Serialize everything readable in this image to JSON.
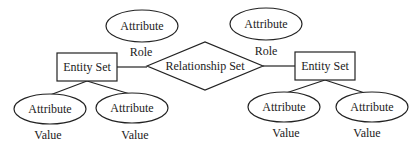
{
  "diagram": {
    "type": "entity-relationship",
    "relationship": {
      "label": "Relationship Set"
    },
    "left": {
      "entity": {
        "label": "Entity Set"
      },
      "role_attribute": {
        "label": "Attribute",
        "caption": "Role"
      },
      "value_attributes": [
        {
          "label": "Attribute",
          "caption": "Value"
        },
        {
          "label": "Attribute",
          "caption": "Value"
        }
      ]
    },
    "right": {
      "entity": {
        "label": "Entity Set"
      },
      "role_attribute": {
        "label": "Attribute",
        "caption": "Role"
      },
      "value_attributes": [
        {
          "label": "Attribute",
          "caption": "Value"
        },
        {
          "label": "Attribute",
          "caption": "Value"
        }
      ]
    }
  }
}
